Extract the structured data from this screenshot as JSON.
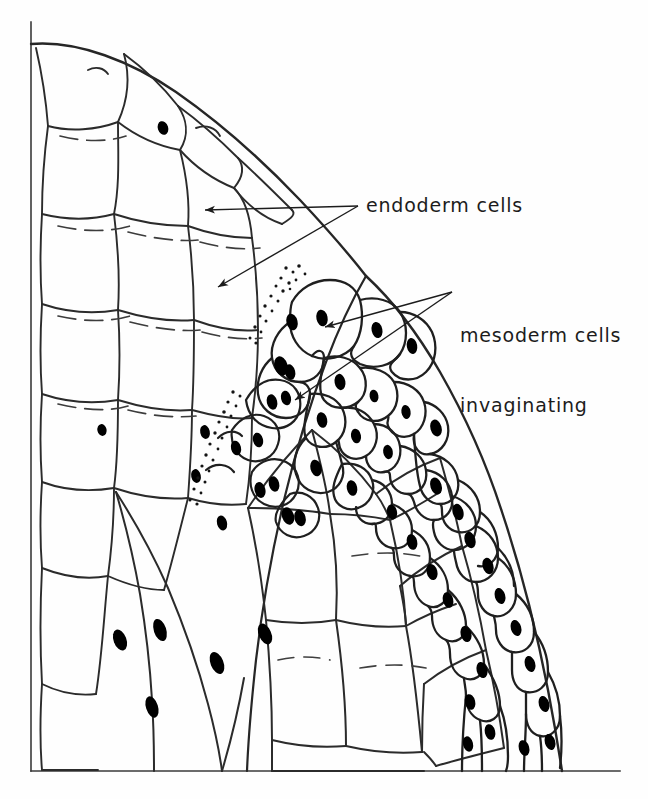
{
  "figure": {
    "kind": "biological-line-drawing",
    "background_color": "#fefefe",
    "ink_color": "#262626",
    "nucleus_color": "#000000",
    "frame": {
      "name": "axis-frame",
      "left_rule_x": 31,
      "top_y": 22,
      "bottom_rule_y": 771,
      "right_x": 620,
      "stroke_width": 1.6
    },
    "labels": [
      {
        "id": "endoderm",
        "lines": [
          "endoderm cells"
        ],
        "x": 366,
        "y": 194,
        "font_size": 19,
        "arrows": [
          {
            "from_x": 358,
            "from_y": 206,
            "to_x": 205,
            "to_y": 210
          },
          {
            "from_x": 358,
            "from_y": 206,
            "to_x": 218,
            "to_y": 287
          }
        ]
      },
      {
        "id": "mesoderm",
        "lines": [
          "mesoderm cells",
          "invaginating"
        ],
        "x": 460,
        "y": 278,
        "font_size": 19,
        "arrows": [
          {
            "from_x": 452,
            "from_y": 292,
            "to_x": 325,
            "to_y": 327
          },
          {
            "from_x": 452,
            "from_y": 292,
            "to_x": 295,
            "to_y": 400
          }
        ]
      }
    ],
    "regions": [
      {
        "name": "endoderm-mass",
        "description": "large pale rounded cells, upper left, sketchy broken outlines, sparse nuclei"
      },
      {
        "name": "mesoderm-layer",
        "description": "small densely packed cells with solid black oval nuclei along right margin and invagination front"
      },
      {
        "name": "stipple-boundary",
        "description": "dotted stippled seam between endoderm mass and invaginating mesoderm"
      },
      {
        "name": "blastocoel-interior",
        "description": "elongated interior cells with slanted oval nuclei, lower centre"
      }
    ]
  }
}
